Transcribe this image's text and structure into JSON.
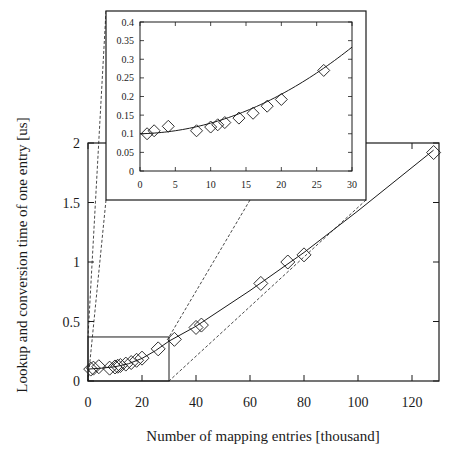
{
  "chart_data": {
    "type": "scatter",
    "title": "",
    "xlabel": "Number of mapping entries [thousand]",
    "ylabel": "Lookup and conversion time of one entry [us]",
    "xlim": [
      0,
      130
    ],
    "ylim": [
      0,
      2
    ],
    "x_ticks": [
      0,
      20,
      40,
      60,
      80,
      100,
      120
    ],
    "y_ticks": [
      0,
      0.5,
      1,
      1.5,
      2
    ],
    "y_tick_labels": [
      "0",
      "0.5",
      "1",
      "1.5",
      "2"
    ],
    "grid": false,
    "legend": null,
    "marker": "diamond",
    "series": [
      {
        "name": "measured",
        "points": [
          {
            "x": 1,
            "y": 0.1
          },
          {
            "x": 2,
            "y": 0.108
          },
          {
            "x": 4,
            "y": 0.12
          },
          {
            "x": 8,
            "y": 0.108
          },
          {
            "x": 10,
            "y": 0.118
          },
          {
            "x": 11,
            "y": 0.124
          },
          {
            "x": 12,
            "y": 0.13
          },
          {
            "x": 14,
            "y": 0.142
          },
          {
            "x": 16,
            "y": 0.155
          },
          {
            "x": 18,
            "y": 0.174
          },
          {
            "x": 20,
            "y": 0.192
          },
          {
            "x": 26,
            "y": 0.27
          },
          {
            "x": 32,
            "y": 0.35
          },
          {
            "x": 40,
            "y": 0.45
          },
          {
            "x": 42,
            "y": 0.47
          },
          {
            "x": 64,
            "y": 0.82
          },
          {
            "x": 74,
            "y": 1.0
          },
          {
            "x": 80,
            "y": 1.06
          },
          {
            "x": 128,
            "y": 1.92
          }
        ]
      },
      {
        "name": "fit curve",
        "type": "line",
        "points": [
          {
            "x": 0,
            "y": 0.1
          },
          {
            "x": 5,
            "y": 0.108
          },
          {
            "x": 10,
            "y": 0.12
          },
          {
            "x": 15,
            "y": 0.145
          },
          {
            "x": 20,
            "y": 0.19
          },
          {
            "x": 25,
            "y": 0.255
          },
          {
            "x": 30,
            "y": 0.335
          },
          {
            "x": 40,
            "y": 0.46
          },
          {
            "x": 60,
            "y": 0.76
          },
          {
            "x": 80,
            "y": 1.08
          },
          {
            "x": 100,
            "y": 1.43
          },
          {
            "x": 128,
            "y": 1.94
          }
        ]
      }
    ],
    "inset": {
      "description": "zoomed view of region x 0-30, y 0-0.4",
      "xlim": [
        0,
        30
      ],
      "ylim": [
        0,
        0.4
      ],
      "x_ticks": [
        0,
        5,
        10,
        15,
        20,
        25,
        30
      ],
      "y_ticks": [
        0,
        0.05,
        0.1,
        0.15,
        0.2,
        0.25,
        0.3,
        0.35,
        0.4
      ],
      "y_tick_labels": [
        "0",
        "0.05",
        "0.1",
        "0.15",
        "0.2",
        "0.25",
        "0.3",
        "0.35",
        "0.4"
      ]
    },
    "annotations": [
      "zoom box around x 0-30, y 0-0.4 connected to inset with dashed lines"
    ]
  },
  "labels": {
    "xlabel": "Number of mapping entries [thousand]",
    "ylabel": "Lookup and conversion time of one entry [us]"
  }
}
